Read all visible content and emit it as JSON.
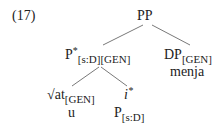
{
  "example_number": "(17)",
  "tree": {
    "root": {
      "label": "PP"
    },
    "left": {
      "label": "P",
      "sup": "*",
      "sub": "[s:D][GEN]"
    },
    "right": {
      "label": "DP",
      "sub": "[GEN]",
      "word": "menja"
    },
    "left_left": {
      "label": "√at",
      "sub": "[GEN]",
      "word": "u"
    },
    "left_right": {
      "label": "i",
      "sup": "*",
      "below_label": "P",
      "below_sub": "[s:D]"
    }
  }
}
